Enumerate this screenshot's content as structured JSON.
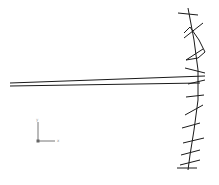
{
  "diagram": {
    "type": "structural line drawing",
    "stroke_color": "#1a1a1a",
    "background": "#ffffff",
    "beam": {
      "upper_line": {
        "x1": 10,
        "y1": 83,
        "x2": 205,
        "y2": 76
      },
      "lower_line": {
        "x1": 10,
        "y1": 86,
        "x2": 200,
        "y2": 83
      }
    },
    "arc_spine": [
      [
        188,
        8
      ],
      [
        194,
        40
      ],
      [
        198,
        70
      ],
      [
        198,
        100
      ],
      [
        194,
        130
      ],
      [
        190,
        155
      ],
      [
        188,
        170
      ]
    ],
    "zigzag": [
      [
        184,
        33
      ],
      [
        190,
        27
      ],
      [
        199,
        40
      ],
      [
        205,
        52
      ],
      [
        198,
        58
      ],
      [
        186,
        60
      ]
    ],
    "ticks": [
      [
        [
          178,
          13
        ],
        [
          198,
          15
        ]
      ],
      [
        [
          184,
          38
        ],
        [
          203,
          23
        ]
      ],
      [
        [
          186,
          60
        ],
        [
          203,
          49
        ]
      ],
      [
        [
          185,
          68
        ],
        [
          205,
          73
        ]
      ],
      [
        [
          188,
          84
        ],
        [
          205,
          80
        ]
      ],
      [
        [
          186,
          97
        ],
        [
          204,
          95
        ]
      ],
      [
        [
          185,
          115
        ],
        [
          203,
          105
        ]
      ],
      [
        [
          182,
          128
        ],
        [
          200,
          123
        ]
      ],
      [
        [
          183,
          143
        ],
        [
          204,
          138
        ]
      ],
      [
        [
          181,
          155
        ],
        [
          200,
          150
        ]
      ],
      [
        [
          180,
          165
        ],
        [
          200,
          160
        ]
      ],
      [
        [
          177,
          168
        ],
        [
          197,
          168
        ]
      ]
    ],
    "axis_triad": {
      "origin": [
        38,
        141
      ],
      "x_axis_end": [
        55,
        141
      ],
      "y_axis_end": [
        38,
        122
      ],
      "x_label": "x",
      "y_label": "y"
    }
  }
}
